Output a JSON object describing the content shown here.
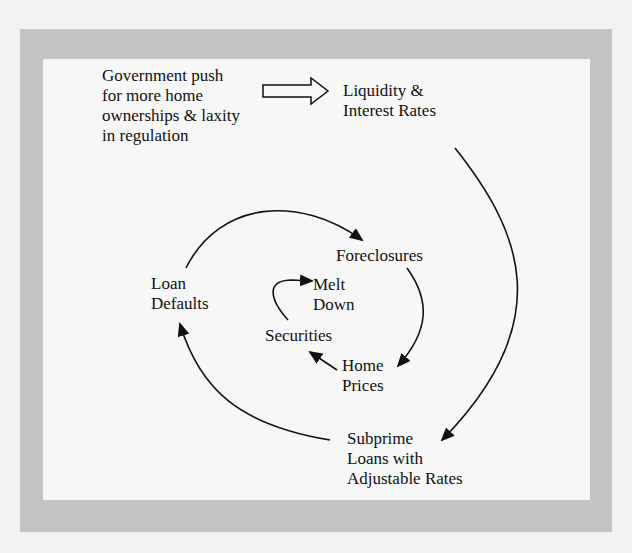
{
  "diagram": {
    "title": "",
    "nodes": {
      "government": {
        "text": "Government push\nfor more home\nownerships & laxity\nin regulation"
      },
      "liquidity": {
        "text": "Liquidity &\nInterest Rates"
      },
      "foreclosures": {
        "text": "Foreclosures"
      },
      "loan_defaults": {
        "text": "Loan\nDefaults"
      },
      "melt_down": {
        "text": "Melt\nDown"
      },
      "securities": {
        "text": "Securities"
      },
      "home_prices": {
        "text": "Home\nPrices"
      },
      "subprime": {
        "text": "Subprime\nLoans with\nAdjustable Rates"
      }
    },
    "edges": [
      {
        "from": "government",
        "to": "liquidity",
        "style": "block-arrow"
      },
      {
        "from": "liquidity",
        "to": "subprime",
        "style": "curved"
      },
      {
        "from": "subprime",
        "to": "loan_defaults",
        "style": "curved"
      },
      {
        "from": "loan_defaults",
        "to": "foreclosures",
        "style": "curved"
      },
      {
        "from": "foreclosures",
        "to": "home_prices",
        "style": "curved"
      },
      {
        "from": "home_prices",
        "to": "securities",
        "style": "straight"
      },
      {
        "from": "securities",
        "to": "melt_down",
        "style": "curved"
      }
    ],
    "colors": {
      "frame": "#c4c4c4",
      "panel": "#f7f7f7",
      "ink": "#111111"
    }
  }
}
